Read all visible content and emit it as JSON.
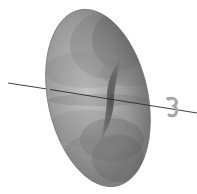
{
  "diagram": {
    "elements": [
      {
        "id": "torus",
        "label": "",
        "description": "semi-transparent gray torus (solid of revolution)"
      },
      {
        "id": "axis",
        "label": "",
        "description": "axis of revolution line"
      },
      {
        "id": "rotation-arrow",
        "label": "",
        "description": "curved arrow indicating rotation about the axis"
      }
    ],
    "colors": {
      "background": "#ffffff",
      "torus_light": "#b8b8b8",
      "torus_mid": "#8a8a8a",
      "torus_dark": "#4a4a4a",
      "axis": "#2a2a2a",
      "arrow": "#a0a0a0"
    },
    "axis": {
      "x1": 8,
      "y1": 83,
      "x2": 197,
      "y2": 113
    }
  }
}
